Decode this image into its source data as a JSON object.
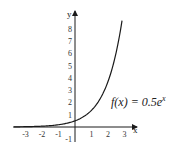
{
  "chart_data": {
    "type": "line",
    "title": "",
    "function": "f(x) = 0.5e^x",
    "annotation": {
      "prefix": "f(x) = 0.5e",
      "superscript": "x"
    },
    "xlabel": "x",
    "ylabel": "y",
    "xlim": [
      -3.7,
      3.5
    ],
    "ylim": [
      -1.2,
      9.3
    ],
    "x_ticks": [
      -3,
      -2,
      -1,
      1,
      2,
      3
    ],
    "x_tick_labels": [
      "-3",
      "-2",
      "-1",
      "1",
      "2",
      "3"
    ],
    "y_ticks": [
      -1,
      1,
      2,
      3,
      4,
      5,
      6,
      7,
      8
    ],
    "y_tick_labels": [
      "-1",
      "1",
      "2",
      "3",
      "4",
      "5",
      "6",
      "7",
      "8"
    ],
    "grid": false,
    "legend": null,
    "series": [
      {
        "name": "f(x) = 0.5e^x",
        "x": [
          -3.7,
          -3,
          -2.5,
          -2,
          -1.5,
          -1,
          -0.5,
          0,
          0.5,
          1,
          1.5,
          2,
          2.5,
          2.85
        ],
        "values": [
          0.012,
          0.025,
          0.041,
          0.068,
          0.112,
          0.184,
          0.303,
          0.5,
          0.824,
          1.359,
          2.241,
          3.695,
          6.091,
          8.64
        ]
      }
    ],
    "colors": {
      "curve": "#1a1a1a",
      "axes": "#1a1a1a"
    }
  }
}
